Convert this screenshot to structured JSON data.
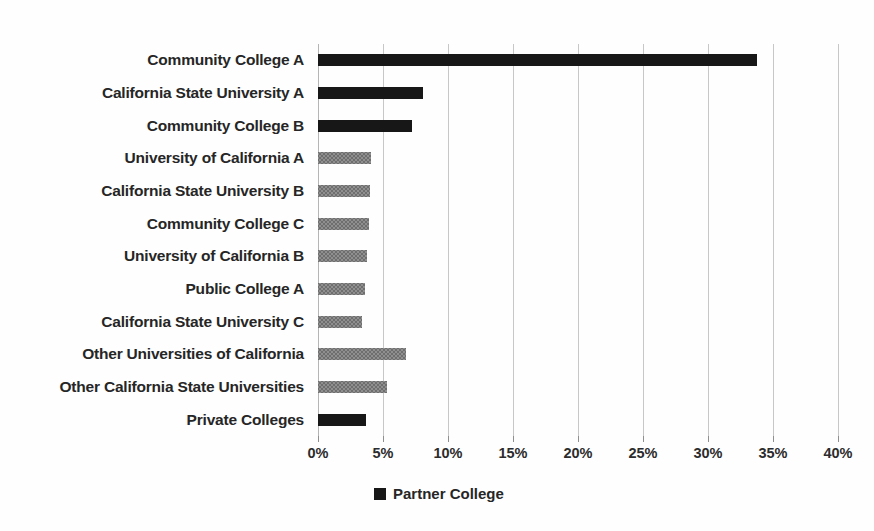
{
  "chart_data": {
    "type": "bar",
    "orientation": "horizontal",
    "title": "",
    "xlabel": "",
    "ylabel": "",
    "xlim": [
      0,
      40
    ],
    "x_tick_step_percent": 5,
    "x_tick_labels": [
      "0%",
      "5%",
      "10%",
      "15%",
      "20%",
      "25%",
      "30%",
      "35%",
      "40%"
    ],
    "grid": true,
    "unit": "%",
    "categories": [
      "Community College A",
      "California State University A",
      "Community College B",
      "University of California A",
      "California State University B",
      "Community College C",
      "University of California B",
      "Public College A",
      "California State University C",
      "Other Universities of California",
      "Other California State Universities",
      "Private Colleges"
    ],
    "values": [
      33.8,
      8.1,
      7.2,
      4.1,
      4.0,
      3.9,
      3.8,
      3.6,
      3.4,
      6.8,
      5.3,
      3.7
    ],
    "partner_flags": [
      true,
      true,
      true,
      false,
      false,
      false,
      false,
      false,
      false,
      false,
      false,
      true
    ],
    "legend": {
      "position": "bottom-center",
      "entries": [
        {
          "label": "Partner College",
          "color": "#171717"
        }
      ]
    },
    "colors": {
      "partner_bar": "#171717",
      "non_partner_bar": "#8f8f8f",
      "gridline": "#c7c7c7",
      "axis_line": "#b5b5b5",
      "tick_mark": "#8f8f8f",
      "text": "#262626"
    }
  }
}
